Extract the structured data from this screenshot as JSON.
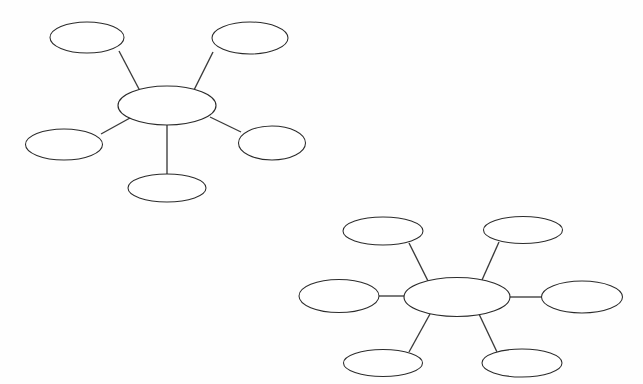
{
  "page": {
    "background_color": "#fefefe",
    "width": 643,
    "height": 384,
    "stroke_color": "#2b2b2b",
    "connector_color": "#3a3a3a"
  },
  "diagrams": [
    {
      "id": "web-diagram-1",
      "name": "five-spoke-concept-web",
      "spoke_count": 5,
      "center": {
        "label": "",
        "cx": 167,
        "cy": 105.5,
        "rx": 49,
        "ry": 19.5
      },
      "nodes": [
        {
          "name": "node-top-left",
          "label": "",
          "cx": 87,
          "cy": 37.5,
          "rx": 37,
          "ry": 15.5
        },
        {
          "name": "node-top-right",
          "label": "",
          "cx": 250,
          "cy": 38,
          "rx": 38,
          "ry": 16
        },
        {
          "name": "node-left",
          "label": "",
          "cx": 64,
          "cy": 144.5,
          "rx": 38.5,
          "ry": 15.5
        },
        {
          "name": "node-right",
          "label": "",
          "cx": 272,
          "cy": 143,
          "rx": 33.5,
          "ry": 17
        },
        {
          "name": "node-bottom",
          "label": "",
          "cx": 167,
          "cy": 188,
          "rx": 39,
          "ry": 14
        }
      ],
      "connectors": [
        {
          "name": "connector-center-to-top-left",
          "x1": 119,
          "y1": 51,
          "x2": 140,
          "y2": 91
        },
        {
          "name": "connector-center-to-top-right",
          "x1": 213,
          "y1": 52,
          "x2": 194,
          "y2": 90
        },
        {
          "name": "connector-center-to-left",
          "x1": 101,
          "y1": 134,
          "x2": 130,
          "y2": 118
        },
        {
          "name": "connector-center-to-right",
          "x1": 241,
          "y1": 132,
          "x2": 210,
          "y2": 117
        },
        {
          "name": "connector-center-to-bottom",
          "x1": 167,
          "y1": 124,
          "x2": 167,
          "y2": 175
        }
      ]
    },
    {
      "id": "web-diagram-2",
      "name": "six-spoke-concept-web",
      "spoke_count": 6,
      "center": {
        "label": "",
        "cx": 457,
        "cy": 297,
        "rx": 53,
        "ry": 19.5
      },
      "nodes": [
        {
          "name": "node-top-left",
          "label": "",
          "cx": 383,
          "cy": 231,
          "rx": 40,
          "ry": 14
        },
        {
          "name": "node-top-right",
          "label": "",
          "cx": 523,
          "cy": 230,
          "rx": 39.5,
          "ry": 13.5
        },
        {
          "name": "node-left",
          "label": "",
          "cx": 339,
          "cy": 296,
          "rx": 40,
          "ry": 16.5
        },
        {
          "name": "node-right",
          "label": "",
          "cx": 582,
          "cy": 297,
          "rx": 40.5,
          "ry": 16
        },
        {
          "name": "node-bottom-left",
          "label": "",
          "cx": 383,
          "cy": 363,
          "rx": 39.5,
          "ry": 13.5
        },
        {
          "name": "node-bottom-right",
          "label": "",
          "cx": 522,
          "cy": 363,
          "rx": 40,
          "ry": 14
        }
      ],
      "connectors": [
        {
          "name": "connector-center-to-top-left",
          "x1": 409,
          "y1": 243,
          "x2": 428,
          "y2": 281
        },
        {
          "name": "connector-center-to-top-right",
          "x1": 499,
          "y1": 242,
          "x2": 482,
          "y2": 280
        },
        {
          "name": "connector-center-to-left",
          "x1": 379,
          "y1": 296,
          "x2": 405,
          "y2": 296
        },
        {
          "name": "connector-center-to-right",
          "x1": 510,
          "y1": 297,
          "x2": 542,
          "y2": 297
        },
        {
          "name": "connector-center-to-bottom-left",
          "x1": 409,
          "y1": 352,
          "x2": 430,
          "y2": 314
        },
        {
          "name": "connector-center-to-bottom-right",
          "x1": 497,
          "y1": 352,
          "x2": 479,
          "y2": 314
        }
      ]
    }
  ]
}
